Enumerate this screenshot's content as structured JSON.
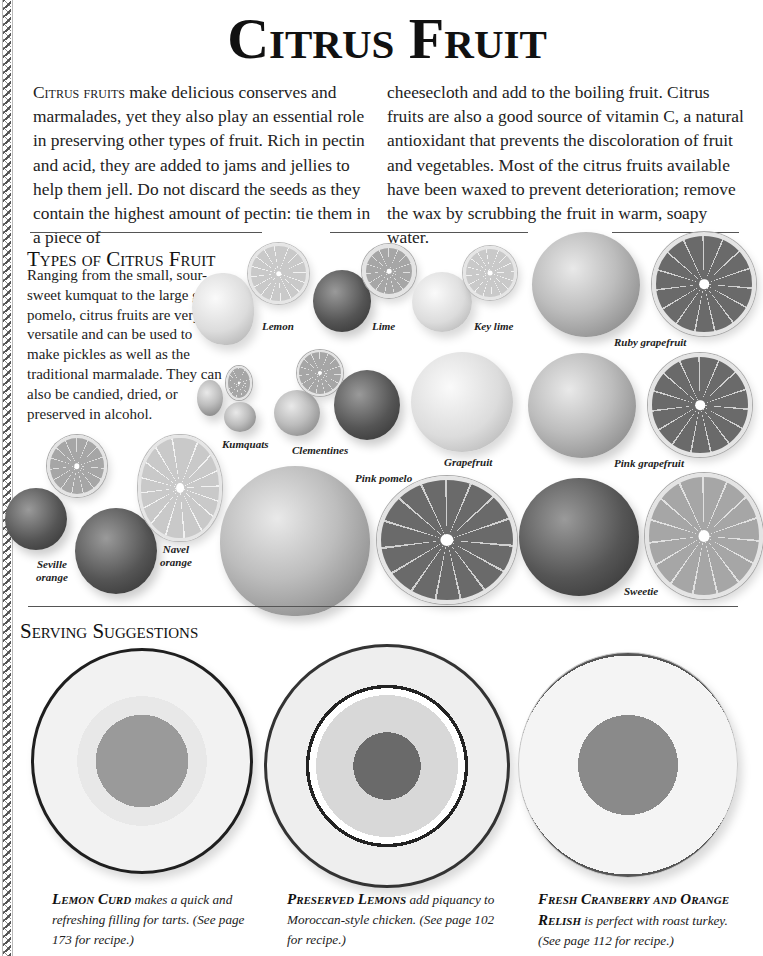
{
  "page": {
    "title": "Citrus Fruit",
    "intro": {
      "lead": "Citrus fruits",
      "col1": " make delicious conserves and marmalades, yet they also play an essential role in preserving other types of fruit. Rich in pectin and acid, they are added to jams and jellies to help them jell. Do not discard the seeds as they contain the highest amount of pectin: tie them in a piece of",
      "col2": "cheesecloth and add to the boiling fruit. Citrus fruits are also a good source of vitamin C, a natural antioxidant that prevents the discoloration of fruit and vegetables. Most of the citrus fruits available have been waxed to prevent deterioration; remove the wax by scrubbing the fruit in warm, soapy water."
    }
  },
  "types": {
    "heading": "Types of Citrus Fruit",
    "description": "Ranging from the small, sour-sweet kumquat to the large green pomelo, citrus fruits are very versatile and can be used to make pickles as well as the traditional marmalade. They can also be candied, dried, or preserved in alcohol.",
    "labels": {
      "lemon": "Lemon",
      "lime": "Lime",
      "key_lime": "Key lime",
      "ruby_grapefruit": "Ruby grapefruit",
      "kumquats": "Kumquats",
      "clementines": "Clementines",
      "grapefruit": "Grapefruit",
      "pink_grapefruit": "Pink grapefruit",
      "pink_pomelo": "Pink pomelo",
      "seville_orange_1": "Seville",
      "seville_orange_2": "orange",
      "navel_orange_1": "Navel",
      "navel_orange_2": "orange",
      "sweetie": "Sweetie"
    }
  },
  "serving": {
    "heading": "Serving Suggestions",
    "items": [
      {
        "name": "Lemon Curd",
        "text": " makes a quick and refreshing filling for tarts. (See page 173 for recipe.)"
      },
      {
        "name": "Preserved Lemons",
        "text": " add piquancy to Moroccan-style chicken. (See page 102 for recipe.)"
      },
      {
        "name": "Fresh Cranberry and Orange Relish",
        "text": " is perfect with roast turkey. (See page 112 for recipe.)"
      }
    ]
  }
}
